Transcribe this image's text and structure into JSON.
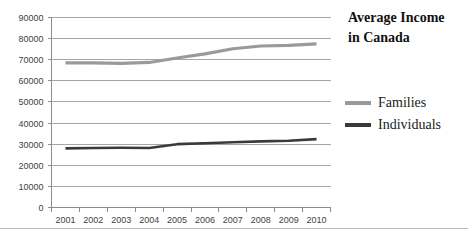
{
  "title": {
    "line1": "Average Income",
    "line2": "in Canada"
  },
  "legend": {
    "items": [
      {
        "label": "Families",
        "color": "#9a9a9a"
      },
      {
        "label": "Individuals",
        "color": "#3a3a3a"
      }
    ]
  },
  "axis": {
    "y_ticks": [
      "90000",
      "80000",
      "70000",
      "60000",
      "50000",
      "40000",
      "30000",
      "20000",
      "10000",
      "0"
    ],
    "x_ticks": [
      "2001",
      "2002",
      "2003",
      "2004",
      "2005",
      "2006",
      "2007",
      "2008",
      "2009",
      "2010"
    ]
  },
  "chart_data": {
    "type": "line",
    "title": "Average Income in Canada",
    "xlabel": "",
    "ylabel": "",
    "x": [
      "2001",
      "2002",
      "2003",
      "2004",
      "2005",
      "2006",
      "2007",
      "2008",
      "2009",
      "2010"
    ],
    "categories": [
      "2001",
      "2002",
      "2003",
      "2004",
      "2005",
      "2006",
      "2007",
      "2008",
      "2009",
      "2010"
    ],
    "series": [
      {
        "name": "Families",
        "color": "#9a9a9a",
        "values": [
          68500,
          68500,
          68300,
          68700,
          70800,
          72800,
          75200,
          76500,
          76800,
          77500
        ]
      },
      {
        "name": "Individuals",
        "color": "#3a3a3a",
        "values": [
          28000,
          28200,
          28300,
          28200,
          30000,
          30400,
          30900,
          31300,
          31600,
          32400
        ]
      }
    ],
    "ylim": [
      0,
      90000
    ],
    "ytick_step": 10000,
    "grid": true,
    "grid_axis": "y",
    "legend_position": "right"
  }
}
